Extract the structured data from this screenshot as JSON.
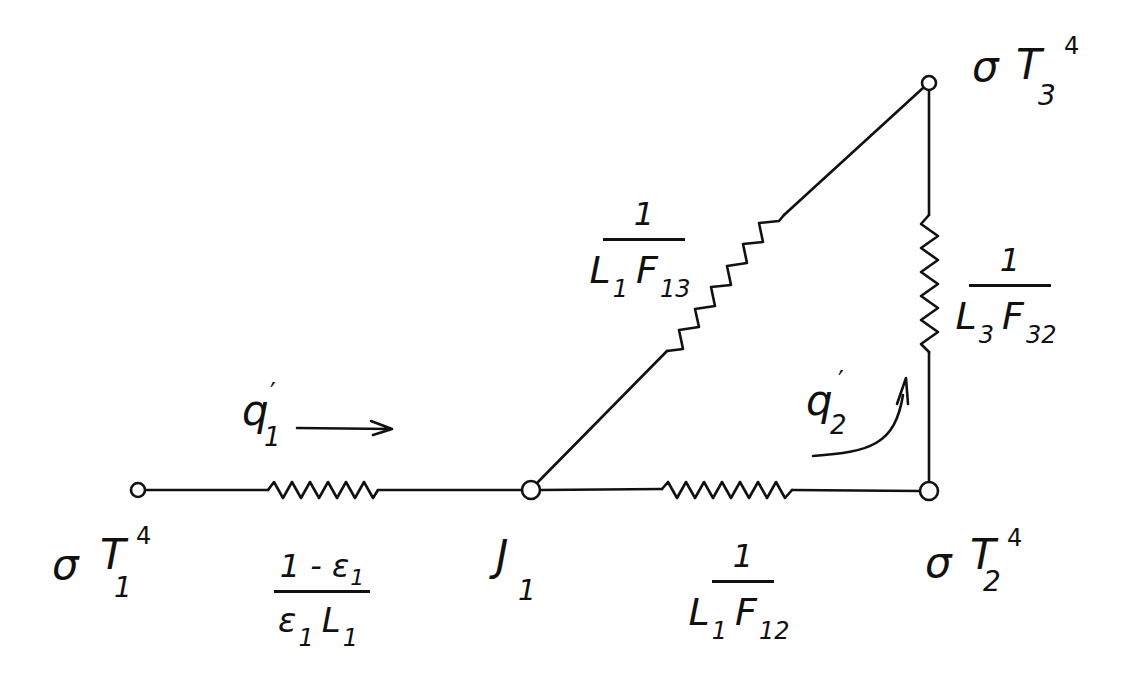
{
  "diagram": {
    "ink_color": "#111111",
    "background_color": "#ffffff",
    "nodes": {
      "eb1": {
        "symbol": "σ",
        "var": "T",
        "sub": "1",
        "sup": "4"
      },
      "j1": {
        "var": "J",
        "sub": "1"
      },
      "eb2": {
        "symbol": "σ",
        "var": "T",
        "sub": "2",
        "sup": "4"
      },
      "eb3": {
        "symbol": "σ",
        "var": "T",
        "sub": "3",
        "sup": "4"
      }
    },
    "resistances": {
      "surface_1": {
        "numerator": "1 - ε",
        "numerator_sub": "1",
        "den_a": "ε",
        "den_a_sub": "1",
        "den_b": "L",
        "den_b_sub": "1"
      },
      "space_12": {
        "numerator": "1",
        "den_a": "L",
        "den_a_sub": "1",
        "den_b": "F",
        "den_b_sub": "12"
      },
      "space_13": {
        "numerator": "1",
        "den_a": "L",
        "den_a_sub": "1",
        "den_b": "F",
        "den_b_sub": "13"
      },
      "space_32": {
        "numerator": "1",
        "den_a": "L",
        "den_a_sub": "3",
        "den_b": "F",
        "den_b_sub": "32"
      }
    },
    "heat_flows": {
      "q1": {
        "var": "q",
        "prime": "′",
        "sub": "1",
        "direction": "right"
      },
      "q2": {
        "var": "q",
        "prime": "′",
        "sub": "2",
        "direction": "up"
      }
    }
  }
}
